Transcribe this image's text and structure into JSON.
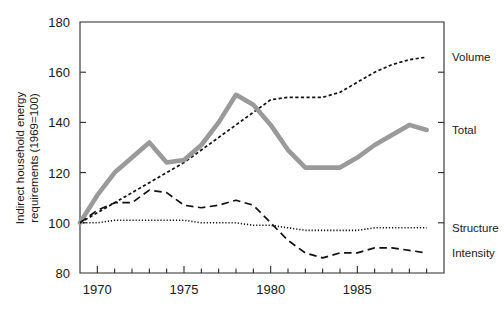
{
  "chart_data": {
    "type": "line",
    "title": "",
    "xlabel": "",
    "ylabel": "Indirect household energy requirements (1969=100)",
    "xlim": [
      1969,
      1990
    ],
    "ylim": [
      80,
      180
    ],
    "grid": false,
    "legend_position": "right-inline",
    "x_major_ticks": [
      1970,
      1975,
      1980,
      1985
    ],
    "x_major_tick_labels": [
      "1970",
      "1975",
      "1980",
      "1985"
    ],
    "x_minor_tick_interval": 1,
    "y_ticks": [
      80,
      100,
      120,
      140,
      160,
      180
    ],
    "y_tick_labels": [
      "80",
      "100",
      "120",
      "140",
      "160",
      "180"
    ],
    "x": [
      1969,
      1970,
      1971,
      1972,
      1973,
      1974,
      1975,
      1976,
      1977,
      1978,
      1979,
      1980,
      1981,
      1982,
      1983,
      1984,
      1985,
      1986,
      1987,
      1988,
      1989
    ],
    "series": [
      {
        "name": "Volume",
        "style": "dashed-fine",
        "color": "#111111",
        "label": "Volume",
        "label_value": 166,
        "values": [
          100,
          104,
          108,
          112,
          116,
          120,
          124,
          129,
          134,
          139,
          144,
          149,
          150,
          150,
          150,
          152,
          156,
          160,
          163,
          165,
          166
        ]
      },
      {
        "name": "Total",
        "style": "thick-grey",
        "color": "#9a9a9a",
        "label": "Total",
        "label_value": 137,
        "values": [
          100,
          111,
          120,
          126,
          132,
          124,
          125,
          131,
          140,
          151,
          147,
          139,
          129,
          122,
          122,
          122,
          126,
          131,
          135,
          139,
          137
        ]
      },
      {
        "name": "Structure",
        "style": "dotted",
        "color": "#111111",
        "label": "Structure",
        "label_value": 98,
        "values": [
          100,
          100,
          101,
          101,
          101,
          101,
          101,
          100,
          100,
          100,
          99,
          99,
          98,
          97,
          97,
          97,
          97,
          98,
          98,
          98,
          98
        ]
      },
      {
        "name": "Intensity",
        "style": "dashed-long",
        "color": "#111111",
        "label": "Intensity",
        "label_value": 88,
        "values": [
          100,
          105,
          108,
          108,
          113,
          112,
          107,
          106,
          107,
          109,
          107,
          100,
          93,
          88,
          86,
          88,
          88,
          90,
          90,
          89,
          88
        ]
      }
    ]
  },
  "axis_labels": {
    "y_title_line1": "Indirect household energy",
    "y_title_line2": "requirements (1969=100)"
  }
}
